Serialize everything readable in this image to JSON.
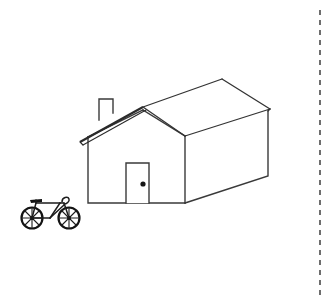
{
  "canvas": {
    "width": 335,
    "height": 306,
    "background_color": "#ffffff",
    "ink_color": "#2b2b2b",
    "style": "black-and-white line drawing / sketch"
  },
  "scene": {
    "title": "House with bicycle line drawing",
    "description": "Simple outline drawing of a gabled house in three-quarter perspective with a bicycle parked at lower left and a vertical dashed guide line near the right edge"
  },
  "objects": {
    "house": {
      "label": "house",
      "front_wall": {
        "label": "front wall",
        "left_x": 88,
        "right_x": 185,
        "top_y": 135,
        "bottom_y": 203
      },
      "side_wall": {
        "label": "right side wall",
        "near_x": 185,
        "far_x": 268,
        "near_bottom_y": 203,
        "far_bottom_y": 175
      },
      "roof": {
        "label": "roof",
        "peak_point": [
          143,
          108
        ],
        "ridge_far_point": [
          222,
          79
        ],
        "left_eave_point": [
          80,
          142
        ],
        "right_eave_point": [
          269,
          110
        ],
        "overhang": true
      },
      "chimney": {
        "label": "chimney",
        "x": 99,
        "y": 99,
        "width": 14,
        "height": 21
      },
      "door": {
        "label": "front door",
        "x": 126,
        "y": 163,
        "width": 23,
        "height": 40,
        "knob": {
          "label": "doorknob",
          "cx": 143,
          "cy": 184,
          "r": 2.6,
          "color": "#161616"
        }
      }
    },
    "bicycle": {
      "label": "bicycle",
      "rear_wheel": {
        "cx": 32,
        "cy": 218,
        "r": 11
      },
      "front_wheel": {
        "cx": 69,
        "cy": 218,
        "r": 11
      },
      "spoke_count": 8,
      "has_seat": true,
      "has_handlebars": true,
      "color": "#141414"
    },
    "guide_line": {
      "label": "vertical dashed guide line",
      "x": 320,
      "y_start": 10,
      "y_end": 296,
      "dash_pattern": "5 5",
      "color": "#4a4a4a"
    }
  }
}
